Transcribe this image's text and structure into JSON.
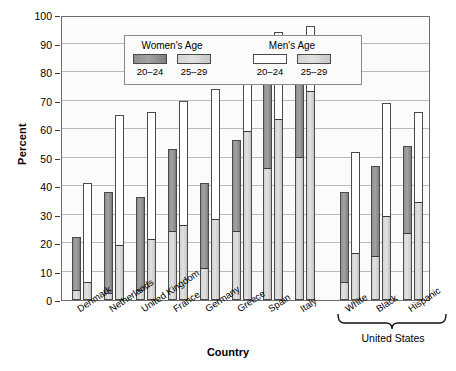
{
  "chart_data": {
    "type": "bar",
    "title": "",
    "xlabel": "Country",
    "ylabel": "Percent",
    "ylim": [
      0,
      100
    ],
    "ytick_step": 10,
    "yticks": [
      0,
      10,
      20,
      30,
      40,
      50,
      60,
      70,
      80,
      90,
      100
    ],
    "grid": true,
    "legend_position": "top-left inside plot",
    "legend": {
      "groups": [
        {
          "title": "Women's Age",
          "entries": [
            {
              "label": "20–24",
              "swatch": "dark"
            },
            {
              "label": "25–29",
              "swatch": "light"
            }
          ]
        },
        {
          "title": "Men's Age",
          "entries": [
            {
              "label": "20–24",
              "swatch": "white"
            },
            {
              "label": "25–29",
              "swatch": "light"
            }
          ]
        }
      ]
    },
    "categories": [
      "Denmark",
      "Netherlands",
      "United Kingdom",
      "France",
      "Germany",
      "Greece",
      "Spain",
      "Italy",
      "White",
      "Black",
      "Hispanic"
    ],
    "group_annotation": {
      "label": "United States",
      "covers": [
        "White",
        "Black",
        "Hispanic"
      ]
    },
    "series": [
      {
        "name": "Women 20–24",
        "values": [
          22,
          38,
          36,
          53,
          41,
          56,
          86,
          89,
          38,
          47,
          54
        ]
      },
      {
        "name": "Women 25–29",
        "values": [
          3,
          2,
          3,
          24,
          11,
          24,
          46,
          50,
          6,
          15,
          23
        ]
      },
      {
        "name": "Men 20–24",
        "values": [
          41,
          65,
          66,
          70,
          74,
          81,
          94,
          96,
          52,
          69,
          66
        ]
      },
      {
        "name": "Men 25–29",
        "values": [
          6,
          19,
          21,
          26,
          28,
          59,
          63,
          73,
          16,
          29,
          34
        ]
      }
    ]
  },
  "colors": {
    "dark_grey": "#9a9a9a",
    "light_grey": "#dadada",
    "white": "#ffffff",
    "outline": "#4a4a4a",
    "gridline": "#b9b9b9",
    "text": "#000000"
  }
}
